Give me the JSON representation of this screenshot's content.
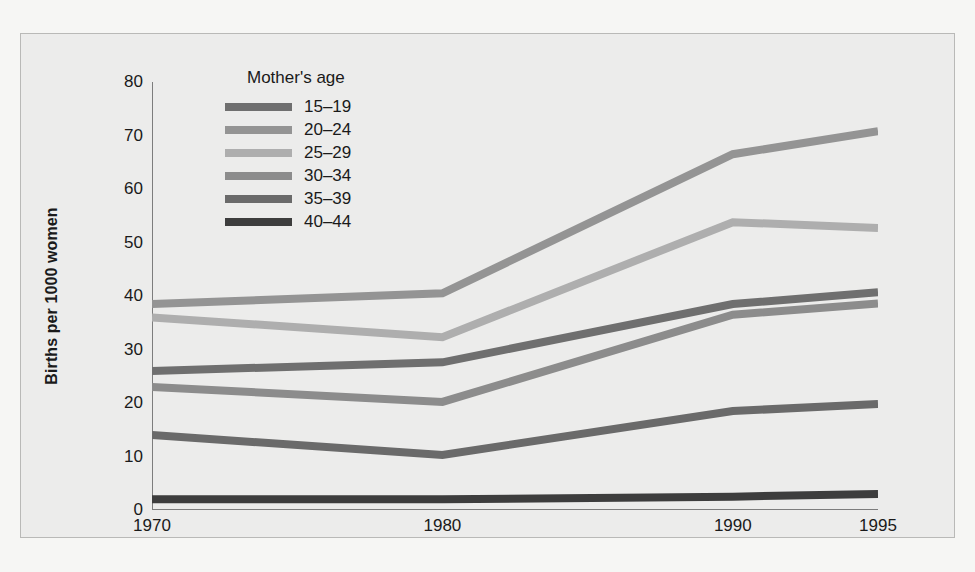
{
  "chart_data": {
    "type": "line",
    "title": "",
    "xlabel": "",
    "ylabel": "Births per 1000 women",
    "legend_title": "Mother's age",
    "legend_position": "top-left-inside",
    "grid": false,
    "x": [
      1970,
      1980,
      1990,
      1995
    ],
    "xtick_labels": [
      "1970",
      "1980",
      "1990",
      "1995"
    ],
    "xlim": [
      1970,
      1995
    ],
    "ylim": [
      0,
      80
    ],
    "ytick_labels": [
      "0",
      "10",
      "20",
      "30",
      "40",
      "50",
      "60",
      "70",
      "80"
    ],
    "yticks": [
      0,
      10,
      20,
      30,
      40,
      50,
      60,
      70,
      80
    ],
    "series": [
      {
        "name": "15–19",
        "color": "#6f6f6f",
        "values": [
          26,
          27.6,
          38.5,
          40.7
        ]
      },
      {
        "name": "20–24",
        "color": "#949494",
        "values": [
          38.5,
          40.5,
          66.5,
          70.8
        ]
      },
      {
        "name": "25–29",
        "color": "#aeaeae",
        "values": [
          36,
          32.3,
          53.8,
          52.7
        ]
      },
      {
        "name": "30–34",
        "color": "#8c8c8c",
        "values": [
          23,
          20.2,
          36.5,
          38.6
        ]
      },
      {
        "name": "35–39",
        "color": "#6a6a6a",
        "values": [
          14,
          10.3,
          18.5,
          19.8
        ]
      },
      {
        "name": "40–44",
        "color": "#3d3d3d",
        "values": [
          2,
          2,
          2.5,
          3
        ]
      }
    ]
  },
  "axis": {
    "line_color": "#7d7d7d",
    "tick_color": "#7d7d7d"
  },
  "panel": {
    "background": "#ececeb",
    "border_color": "#b9b9b7"
  }
}
